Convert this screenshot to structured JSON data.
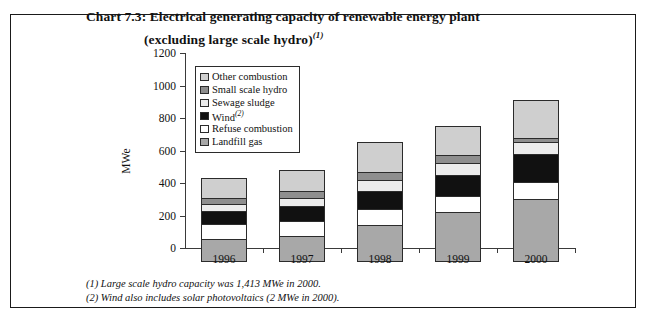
{
  "title": {
    "line1": "Chart 7.3:  Electrical generating capacity of renewable energy plant",
    "line2": "(excluding large scale hydro)",
    "line2_sup": "(1)"
  },
  "legend": {
    "items": [
      {
        "label": "Other combustion",
        "sup": "",
        "color": "#cfcfcf",
        "key": "other"
      },
      {
        "label": "Small scale hydro",
        "sup": "",
        "color": "#8e8e8e",
        "key": "smallhydro"
      },
      {
        "label": "Sewage sludge",
        "sup": "",
        "color": "#ececec",
        "key": "sewage"
      },
      {
        "label": "Wind",
        "sup": "(2)",
        "color": "#111111",
        "key": "wind"
      },
      {
        "label": "Refuse combustion",
        "sup": "",
        "color": "#ffffff",
        "key": "refuse"
      },
      {
        "label": "Landfill gas",
        "sup": "",
        "color": "#a8a8a8",
        "key": "landfill"
      }
    ]
  },
  "footnotes": [
    "(1) Large scale hydro capacity was 1,413 MWe in 2000.",
    "(2) Wind also includes solar photovoltaics (2 MWe in 2000)."
  ],
  "chart_data": {
    "type": "bar",
    "stacked": true,
    "title": "Chart 7.3:  Electrical generating capacity of renewable energy plant (excluding large scale hydro)",
    "xlabel": "",
    "ylabel": "MWe",
    "ylim": [
      0,
      1200
    ],
    "yticks": [
      0,
      200,
      400,
      600,
      800,
      1000,
      1200
    ],
    "ytick_labels": [
      "0",
      "200",
      "400",
      "600",
      "800",
      "1000",
      "1200"
    ],
    "grid": false,
    "legend_position": "upper-left-inside",
    "categories": [
      "1996",
      "1997",
      "1998",
      "1999",
      "2000"
    ],
    "series": [
      {
        "name": "Landfill gas",
        "color": "#a8a8a8",
        "values": [
          140,
          160,
          230,
          305,
          390
        ]
      },
      {
        "name": "Refuse combustion",
        "color": "#ffffff",
        "values": [
          100,
          100,
          105,
          105,
          110
        ]
      },
      {
        "name": "Wind",
        "color": "#111111",
        "values": [
          85,
          95,
          115,
          140,
          180
        ]
      },
      {
        "name": "Sewage sludge",
        "color": "#ececec",
        "values": [
          50,
          55,
          75,
          75,
          75
        ]
      },
      {
        "name": "Small scale hydro",
        "color": "#8e8e8e",
        "values": [
          45,
          50,
          55,
          60,
          30
        ]
      },
      {
        "name": "Other combustion",
        "color": "#cfcfcf",
        "values": [
          125,
          135,
          190,
          180,
          240
        ]
      }
    ],
    "totals": [
      545,
      595,
      770,
      865,
      1025
    ]
  }
}
